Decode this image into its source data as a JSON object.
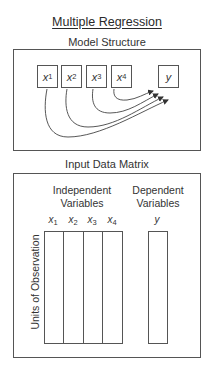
{
  "title": "Multiple Regression",
  "model_structure": {
    "heading": "Model Structure",
    "independent_vars": [
      {
        "name": "x",
        "sub": "1"
      },
      {
        "name": "x",
        "sub": "2"
      },
      {
        "name": "x",
        "sub": "3"
      },
      {
        "name": "x",
        "sub": "4"
      }
    ],
    "dependent_var": {
      "name": "y"
    },
    "arrows": [
      {
        "from": "x1",
        "to": "y"
      },
      {
        "from": "x2",
        "to": "y"
      },
      {
        "from": "x3",
        "to": "y"
      },
      {
        "from": "x4",
        "to": "y"
      }
    ]
  },
  "input_data_matrix": {
    "heading": "Input Data Matrix",
    "independent_group_line1": "Independent",
    "independent_group_line2": "Variables",
    "dependent_group_line1": "Dependent",
    "dependent_group_line2": "Variables",
    "columns": [
      {
        "name": "x",
        "sub": "1"
      },
      {
        "name": "x",
        "sub": "2"
      },
      {
        "name": "x",
        "sub": "3"
      },
      {
        "name": "x",
        "sub": "4"
      }
    ],
    "dependent_column": {
      "name": "y"
    },
    "row_axis_label": "Units of Observation"
  },
  "colors": {
    "line": "#555555",
    "text": "#2a2a2a",
    "background": "#ffffff"
  }
}
